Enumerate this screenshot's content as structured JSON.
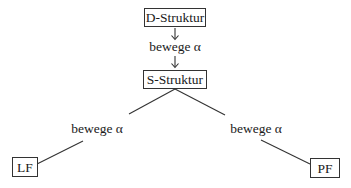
{
  "diagram": {
    "nodes": {
      "d_struktur": {
        "label": "D-Struktur"
      },
      "s_struktur": {
        "label": "S-Struktur"
      },
      "lf": {
        "label": "LF"
      },
      "pf": {
        "label": "PF"
      }
    },
    "edges": {
      "d_to_s": {
        "label": "bewege α",
        "from": "D-Struktur",
        "to": "S-Struktur"
      },
      "s_to_lf": {
        "label": "bewege α",
        "from": "S-Struktur",
        "to": "LF"
      },
      "s_to_pf": {
        "label": "bewege α",
        "from": "S-Struktur",
        "to": "PF"
      }
    },
    "arrow_glyph": "↓"
  }
}
